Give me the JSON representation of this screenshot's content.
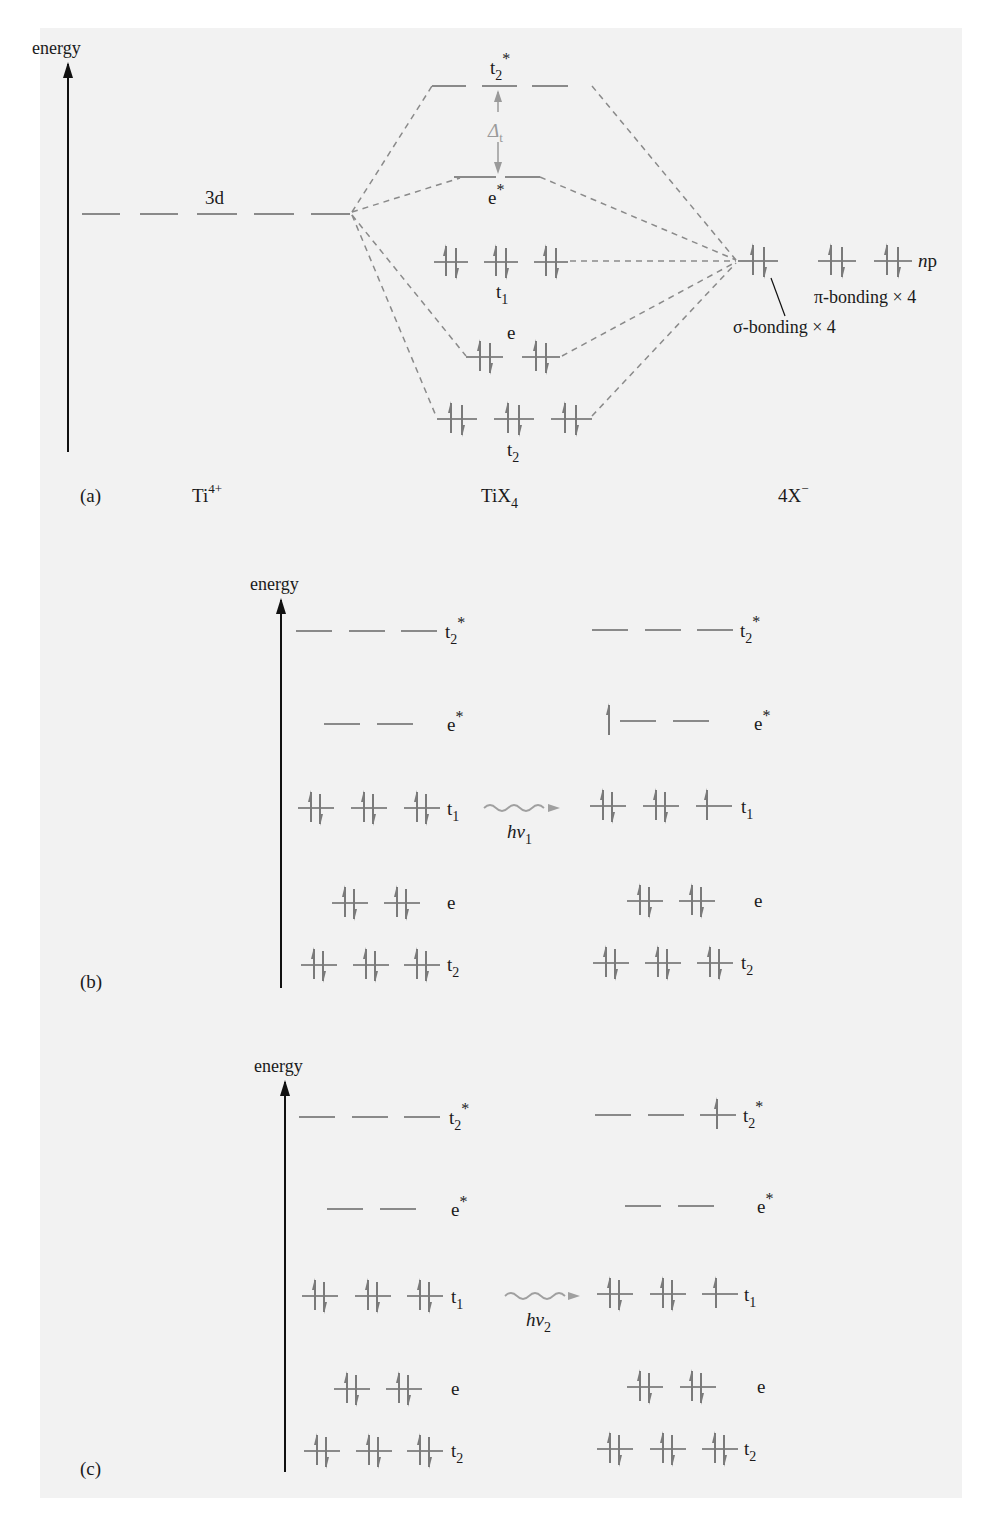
{
  "figure": {
    "panel_a": {
      "label": "(a)",
      "axis_label": "energy",
      "columns": {
        "left": "Ti",
        "left_sup": "4+",
        "middle": "TiX",
        "middle_sub": "4",
        "right": "4X",
        "right_sup": "−"
      },
      "metal_level": "3d",
      "mo_levels": {
        "t2_star": {
          "base": "t",
          "sub": "2",
          "sup": "*"
        },
        "e_star": {
          "base": "e",
          "sup": "*"
        },
        "t1": {
          "base": "t",
          "sub": "1"
        },
        "e": {
          "base": "e"
        },
        "t2": {
          "base": "t",
          "sub": "2"
        }
      },
      "splitting": {
        "symbol": "Δ",
        "sub": "t"
      },
      "ligand_level": {
        "prefix": "n",
        "suffix": "p"
      },
      "annotations": {
        "pi": "π-bonding × 4",
        "sigma": "σ-bonding × 4"
      }
    },
    "panel_b": {
      "label": "(b)",
      "axis_label": "energy",
      "transition": {
        "h": "h",
        "nu": "ν",
        "sub": "1"
      }
    },
    "panel_c": {
      "label": "(c)",
      "axis_label": "energy",
      "transition": {
        "h": "h",
        "nu": "ν",
        "sub": "2"
      }
    },
    "level_labels": {
      "t2_star": {
        "base": "t",
        "sub": "2",
        "sup": "*"
      },
      "e_star": {
        "base": "e",
        "sup": "*"
      },
      "t1": {
        "base": "t",
        "sub": "1"
      },
      "e": {
        "base": "e"
      },
      "t2": {
        "base": "t",
        "sub": "2"
      }
    },
    "colors": {
      "ink": "#1a1a1a",
      "level": "#8a8a8a",
      "panel_bg": "#f2f2f2",
      "photon": "#a0a0a0"
    }
  }
}
